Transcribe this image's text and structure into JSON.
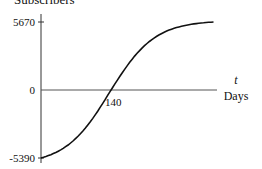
{
  "chart_data": {
    "type": "line",
    "title": "",
    "ylabel": "Subscribers",
    "xlabel": "Days",
    "x_variable": "t",
    "yticks": [
      {
        "value": 5670,
        "label": "5670"
      },
      {
        "value": 0,
        "label": "0"
      },
      {
        "value": -5390,
        "label": "-5390"
      }
    ],
    "xticks": [
      {
        "value": 140,
        "label": "140"
      }
    ],
    "ylim": [
      -5390,
      5670
    ],
    "xlim": [
      0,
      350
    ],
    "grid": false,
    "legend": null,
    "series": [
      {
        "name": "Subscribers",
        "shape": "logistic (S-curve)",
        "x": [
          0,
          35,
          70,
          105,
          140,
          175,
          210,
          245,
          280,
          315,
          350
        ],
        "values": [
          -5390,
          -4900,
          -3800,
          -2100,
          0,
          2200,
          3900,
          4800,
          5300,
          5550,
          5670
        ]
      }
    ],
    "annotations": [
      {
        "text": "140",
        "note": "x-intercept where curve crosses 0"
      }
    ]
  },
  "labels": {
    "y_axis_title": "Subscribers",
    "y_top": "5670",
    "y_zero": "0",
    "y_bottom": "-5390",
    "x_intercept": "140",
    "x_var": "t",
    "x_axis_title": "Days"
  }
}
